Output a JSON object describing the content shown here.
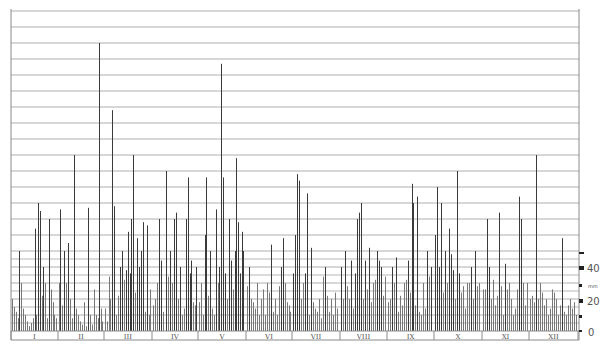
{
  "chart_data": {
    "type": "bar",
    "title": "",
    "xlabel": "",
    "ylabel": "mm",
    "y_axis": {
      "unit": "mm",
      "ticks": [
        {
          "value": 0,
          "label": "0"
        },
        {
          "value": 20,
          "label": "20"
        },
        {
          "value": 40,
          "label": "40"
        }
      ],
      "ylim": [
        0,
        200
      ],
      "grid_major_step": 10,
      "grid_fine_step": 5,
      "grid_fine_below": 50,
      "position": "right"
    },
    "categories": [
      "I",
      "II",
      "III",
      "IV",
      "V",
      "VI",
      "VII",
      "VIII",
      "IX",
      "X",
      "XI",
      "XII"
    ],
    "month_bounds_px": [
      11,
      58,
      104,
      152,
      198,
      246,
      292,
      340,
      387,
      434,
      482,
      529,
      578
    ],
    "bars": [
      [
        12,
        20
      ],
      [
        14,
        15
      ],
      [
        16,
        12
      ],
      [
        18,
        8
      ],
      [
        19,
        50
      ],
      [
        21,
        30
      ],
      [
        23,
        14
      ],
      [
        25,
        10
      ],
      [
        27,
        6
      ],
      [
        29,
        3
      ],
      [
        31,
        5
      ],
      [
        33,
        8
      ],
      [
        35,
        64
      ],
      [
        36,
        10
      ],
      [
        38,
        80
      ],
      [
        40,
        75
      ],
      [
        42,
        22
      ],
      [
        43,
        40
      ],
      [
        45,
        30
      ],
      [
        47,
        8
      ],
      [
        49,
        70
      ],
      [
        51,
        26
      ],
      [
        53,
        18
      ],
      [
        54,
        10
      ],
      [
        56,
        8
      ],
      [
        59,
        30
      ],
      [
        60,
        76
      ],
      [
        62,
        16
      ],
      [
        64,
        50
      ],
      [
        66,
        30
      ],
      [
        68,
        55
      ],
      [
        70,
        20
      ],
      [
        72,
        8
      ],
      [
        74,
        110
      ],
      [
        76,
        14
      ],
      [
        78,
        10
      ],
      [
        80,
        6
      ],
      [
        82,
        4
      ],
      [
        84,
        18
      ],
      [
        86,
        3
      ],
      [
        88,
        77
      ],
      [
        90,
        10
      ],
      [
        92,
        4
      ],
      [
        94,
        26
      ],
      [
        96,
        10
      ],
      [
        98,
        8
      ],
      [
        99,
        180
      ],
      [
        101,
        14
      ],
      [
        102,
        6
      ],
      [
        105,
        14
      ],
      [
        107,
        6
      ],
      [
        109,
        34
      ],
      [
        110,
        20
      ],
      [
        112,
        138
      ],
      [
        114,
        78
      ],
      [
        116,
        10
      ],
      [
        118,
        22
      ],
      [
        120,
        40
      ],
      [
        122,
        50
      ],
      [
        124,
        32
      ],
      [
        126,
        38
      ],
      [
        128,
        62
      ],
      [
        130,
        36
      ],
      [
        131,
        70
      ],
      [
        133,
        110
      ],
      [
        135,
        24
      ],
      [
        137,
        58
      ],
      [
        139,
        40
      ],
      [
        141,
        50
      ],
      [
        143,
        68
      ],
      [
        145,
        12
      ],
      [
        147,
        66
      ],
      [
        149,
        10
      ],
      [
        150,
        26
      ],
      [
        153,
        16
      ],
      [
        155,
        20
      ],
      [
        157,
        30
      ],
      [
        159,
        70
      ],
      [
        161,
        44
      ],
      [
        163,
        12
      ],
      [
        166,
        100
      ],
      [
        168,
        34
      ],
      [
        170,
        50
      ],
      [
        172,
        30
      ],
      [
        174,
        70
      ],
      [
        176,
        74
      ],
      [
        178,
        20
      ],
      [
        180,
        40
      ],
      [
        182,
        10
      ],
      [
        184,
        14
      ],
      [
        186,
        70
      ],
      [
        188,
        96
      ],
      [
        190,
        36
      ],
      [
        191,
        44
      ],
      [
        193,
        18
      ],
      [
        195,
        16
      ],
      [
        196,
        40
      ],
      [
        199,
        18
      ],
      [
        201,
        30
      ],
      [
        203,
        10
      ],
      [
        205,
        60
      ],
      [
        206,
        96
      ],
      [
        208,
        22
      ],
      [
        210,
        50
      ],
      [
        212,
        14
      ],
      [
        214,
        10
      ],
      [
        216,
        76
      ],
      [
        218,
        30
      ],
      [
        219,
        40
      ],
      [
        221,
        167
      ],
      [
        223,
        96
      ],
      [
        225,
        36
      ],
      [
        227,
        20
      ],
      [
        229,
        70
      ],
      [
        231,
        44
      ],
      [
        233,
        26
      ],
      [
        235,
        50
      ],
      [
        236,
        108
      ],
      [
        238,
        68
      ],
      [
        240,
        36
      ],
      [
        242,
        62
      ],
      [
        243,
        50
      ],
      [
        247,
        28
      ],
      [
        249,
        40
      ],
      [
        251,
        20
      ],
      [
        253,
        18
      ],
      [
        255,
        14
      ],
      [
        257,
        30
      ],
      [
        259,
        10
      ],
      [
        261,
        20
      ],
      [
        263,
        26
      ],
      [
        265,
        10
      ],
      [
        267,
        30
      ],
      [
        269,
        24
      ],
      [
        271,
        54
      ],
      [
        273,
        12
      ],
      [
        275,
        20
      ],
      [
        277,
        10
      ],
      [
        279,
        28
      ],
      [
        281,
        40
      ],
      [
        283,
        58
      ],
      [
        285,
        30
      ],
      [
        287,
        18
      ],
      [
        289,
        16
      ],
      [
        290,
        12
      ],
      [
        293,
        36
      ],
      [
        295,
        60
      ],
      [
        297,
        98
      ],
      [
        299,
        94
      ],
      [
        301,
        20
      ],
      [
        303,
        30
      ],
      [
        305,
        36
      ],
      [
        307,
        86
      ],
      [
        309,
        10
      ],
      [
        311,
        52
      ],
      [
        313,
        18
      ],
      [
        315,
        14
      ],
      [
        317,
        12
      ],
      [
        319,
        20
      ],
      [
        321,
        8
      ],
      [
        323,
        34
      ],
      [
        325,
        40
      ],
      [
        327,
        22
      ],
      [
        329,
        12
      ],
      [
        331,
        20
      ],
      [
        333,
        10
      ],
      [
        335,
        24
      ],
      [
        337,
        14
      ],
      [
        341,
        40
      ],
      [
        343,
        20
      ],
      [
        345,
        50
      ],
      [
        347,
        28
      ],
      [
        349,
        20
      ],
      [
        351,
        44
      ],
      [
        353,
        14
      ],
      [
        355,
        36
      ],
      [
        357,
        70
      ],
      [
        359,
        74
      ],
      [
        361,
        80
      ],
      [
        363,
        20
      ],
      [
        365,
        44
      ],
      [
        367,
        26
      ],
      [
        369,
        52
      ],
      [
        371,
        18
      ],
      [
        373,
        30
      ],
      [
        375,
        32
      ],
      [
        377,
        50
      ],
      [
        379,
        44
      ],
      [
        381,
        40
      ],
      [
        383,
        22
      ],
      [
        385,
        34
      ],
      [
        388,
        18
      ],
      [
        390,
        20
      ],
      [
        392,
        40
      ],
      [
        394,
        30
      ],
      [
        396,
        46
      ],
      [
        398,
        12
      ],
      [
        400,
        22
      ],
      [
        402,
        16
      ],
      [
        404,
        30
      ],
      [
        406,
        32
      ],
      [
        408,
        44
      ],
      [
        410,
        24
      ],
      [
        412,
        92
      ],
      [
        413,
        80
      ],
      [
        415,
        16
      ],
      [
        417,
        84
      ],
      [
        419,
        12
      ],
      [
        421,
        10
      ],
      [
        423,
        30
      ],
      [
        425,
        14
      ],
      [
        427,
        50
      ],
      [
        429,
        34
      ],
      [
        431,
        40
      ],
      [
        435,
        60
      ],
      [
        437,
        90
      ],
      [
        439,
        40
      ],
      [
        441,
        80
      ],
      [
        443,
        24
      ],
      [
        445,
        50
      ],
      [
        447,
        30
      ],
      [
        449,
        64
      ],
      [
        451,
        48
      ],
      [
        453,
        38
      ],
      [
        455,
        20
      ],
      [
        457,
        100
      ],
      [
        459,
        36
      ],
      [
        461,
        24
      ],
      [
        463,
        28
      ],
      [
        465,
        14
      ],
      [
        467,
        30
      ],
      [
        469,
        30
      ],
      [
        471,
        40
      ],
      [
        473,
        20
      ],
      [
        475,
        50
      ],
      [
        477,
        28
      ],
      [
        479,
        30
      ],
      [
        483,
        26
      ],
      [
        485,
        26
      ],
      [
        487,
        70
      ],
      [
        489,
        40
      ],
      [
        491,
        20
      ],
      [
        493,
        32
      ],
      [
        495,
        16
      ],
      [
        497,
        22
      ],
      [
        499,
        74
      ],
      [
        501,
        28
      ],
      [
        503,
        10
      ],
      [
        505,
        42
      ],
      [
        507,
        26
      ],
      [
        509,
        30
      ],
      [
        511,
        20
      ],
      [
        513,
        10
      ],
      [
        515,
        14
      ],
      [
        517,
        26
      ],
      [
        519,
        84
      ],
      [
        521,
        70
      ],
      [
        523,
        30
      ],
      [
        525,
        16
      ],
      [
        527,
        30
      ],
      [
        530,
        20
      ],
      [
        532,
        22
      ],
      [
        534,
        18
      ],
      [
        536,
        110
      ],
      [
        538,
        20
      ],
      [
        540,
        30
      ],
      [
        542,
        24
      ],
      [
        544,
        16
      ],
      [
        546,
        20
      ],
      [
        548,
        10
      ],
      [
        550,
        14
      ],
      [
        552,
        26
      ],
      [
        554,
        24
      ],
      [
        556,
        20
      ],
      [
        558,
        10
      ],
      [
        560,
        16
      ],
      [
        562,
        58
      ],
      [
        564,
        12
      ],
      [
        566,
        10
      ],
      [
        568,
        16
      ],
      [
        570,
        20
      ],
      [
        572,
        14
      ],
      [
        574,
        18
      ],
      [
        576,
        10
      ]
    ]
  },
  "axis": {
    "label_40": "40",
    "label_mm": "mm",
    "label_20": "20",
    "label_0": "0"
  },
  "months": [
    "I",
    "II",
    "III",
    "IV",
    "V",
    "VI",
    "VII",
    "VIII",
    "IX",
    "X",
    "XI",
    "XII"
  ]
}
